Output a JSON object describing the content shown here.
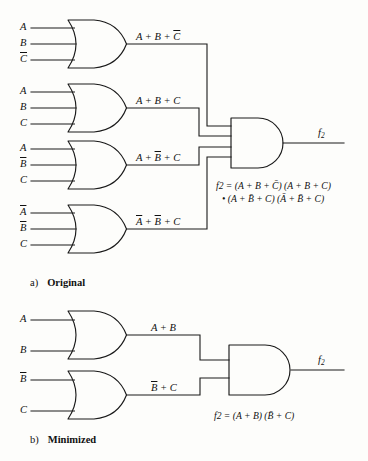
{
  "figure": {
    "ink_color": "#1a1a1a",
    "background": "#fdfdfb"
  },
  "part_a": {
    "caption_letter": "a)",
    "caption_text": "Original",
    "gates": [
      {
        "id": "or1",
        "type": "OR",
        "inputs": [
          "A",
          "B",
          "C̄"
        ],
        "output_label": "A + B + C̄"
      },
      {
        "id": "or2",
        "type": "OR",
        "inputs": [
          "A",
          "B",
          "C"
        ],
        "output_label": "A + B + C"
      },
      {
        "id": "or3",
        "type": "OR",
        "inputs": [
          "A",
          "B̄",
          "C"
        ],
        "output_label": "A + B̄ + C"
      },
      {
        "id": "or4",
        "type": "OR",
        "inputs": [
          "Ā",
          "B̄",
          "C"
        ],
        "output_label": "Ā + B̄ + C"
      },
      {
        "id": "and1",
        "type": "AND",
        "inputs": [
          "A + B + C̄",
          "A + B + C",
          "A + B̄ + C",
          "Ā + B̄ + C"
        ],
        "output_label": "f2"
      }
    ],
    "input_labels": {
      "or1": [
        "A",
        "B",
        "C"
      ],
      "or2": [
        "A",
        "B",
        "C"
      ],
      "or3": [
        "A",
        "B",
        "C"
      ],
      "or4": [
        "A",
        "B",
        "C"
      ]
    },
    "output_labels": {
      "or1_plain": "A + B + ",
      "or1_bar": "C",
      "or2": "A + B + C",
      "or3_pre": "A + ",
      "or3_bar": "B",
      "or3_post": " + C",
      "or4_bar1": "A",
      "or4_mid": " + ",
      "or4_bar2": "B",
      "or4_post": " + C"
    },
    "final_output": "f",
    "final_output_sub": "2",
    "equation_line1": "f2 = (A + B + C̄) (A + B + C)",
    "equation_line2": "• (A + B̄ + C) (Ā + B̄ + C)"
  },
  "part_b": {
    "caption_letter": "b)",
    "caption_text": "Minimized",
    "gates": [
      {
        "id": "or5",
        "type": "OR",
        "inputs": [
          "A",
          "B"
        ],
        "output_label": "A + B"
      },
      {
        "id": "or6",
        "type": "OR",
        "inputs": [
          "B̄",
          "C"
        ],
        "output_label": "B̄ + C"
      },
      {
        "id": "and2",
        "type": "AND",
        "inputs": [
          "A + B",
          "B̄ + C"
        ],
        "output_label": "f2"
      }
    ],
    "output_labels": {
      "or5": "A + B",
      "or6_bar": "B",
      "or6_post": " + C"
    },
    "final_output": "f",
    "final_output_sub": "2",
    "equation": "f2 = (A + B) (B̄ + C)"
  }
}
